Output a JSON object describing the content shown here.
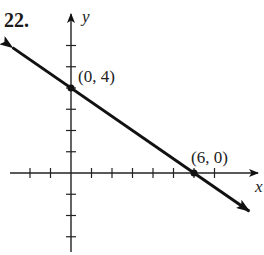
{
  "problem_number": "22.",
  "chart_data": {
    "type": "line",
    "title": "",
    "xlabel": "x",
    "ylabel": "y",
    "grid": false,
    "xlim": [
      -3,
      7
    ],
    "ylim": [
      -5,
      7
    ],
    "x_ticks": [
      -2,
      -1,
      1,
      2,
      3,
      4,
      5,
      6,
      7
    ],
    "y_ticks": [
      -4,
      -3,
      -2,
      -1,
      1,
      2,
      3,
      4,
      5,
      6
    ],
    "series": [
      {
        "name": "line",
        "equation": "y = -2/3 x + 4",
        "x": [
          0,
          6
        ],
        "y": [
          4,
          0
        ],
        "arrows": "both"
      }
    ],
    "annotations": [
      {
        "text": "(0, 4)",
        "x": 0,
        "y": 4
      },
      {
        "text": "(6, 0)",
        "x": 6,
        "y": 0
      }
    ]
  }
}
